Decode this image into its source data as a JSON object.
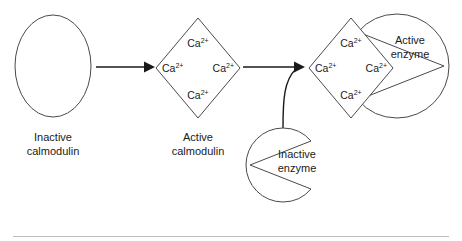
{
  "figure": {
    "ion_label": "Ca",
    "ion_superscript": "2+",
    "divider_color": "#bdbdbd",
    "stroke_color": "#4a4a4a",
    "arrow_color": "#1a1a1a"
  },
  "stages": {
    "inactive_calmodulin": {
      "caption_line1": "Inactive",
      "caption_line2": "calmodulin",
      "shape": "ellipse"
    },
    "active_calmodulin": {
      "caption_line1": "Active",
      "caption_line2": "calmodulin",
      "shape": "diamond",
      "ions": [
        {
          "position": "top",
          "label": "Ca",
          "superscript": "2+"
        },
        {
          "position": "left",
          "label": "Ca",
          "superscript": "2+"
        },
        {
          "position": "right",
          "label": "Ca",
          "superscript": "2+"
        },
        {
          "position": "bottom",
          "label": "Ca",
          "superscript": "2+"
        }
      ]
    },
    "inactive_enzyme": {
      "label_line1": "Inactive",
      "label_line2": "enzyme",
      "shape": "notched-circle"
    },
    "complex": {
      "shape": "diamond",
      "ions": [
        {
          "position": "top",
          "label": "Ca",
          "superscript": "2+"
        },
        {
          "position": "left",
          "label": "Ca",
          "superscript": "2+"
        },
        {
          "position": "right",
          "label": "Ca",
          "superscript": "2+"
        },
        {
          "position": "bottom",
          "label": "Ca",
          "superscript": "2+"
        }
      ]
    },
    "active_enzyme": {
      "label_line1": "Active",
      "label_line2": "enzyme",
      "shape": "notched-circle"
    }
  },
  "arrows": [
    {
      "name": "arrow-1",
      "from": "inactive_calmodulin",
      "to": "active_calmodulin"
    },
    {
      "name": "arrow-2",
      "from": "active_calmodulin",
      "to": "complex"
    },
    {
      "name": "connector-enzyme",
      "from": "inactive_enzyme",
      "to": "complex"
    }
  ]
}
